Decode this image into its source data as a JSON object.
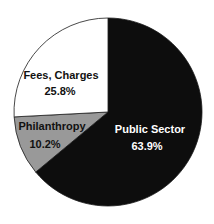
{
  "chart_data": {
    "type": "pie",
    "title": "",
    "start_angle_deg": 0,
    "direction": "clockwise",
    "center": [
      108,
      112
    ],
    "radius": 94,
    "stroke": "#1a1a1a",
    "slices": [
      {
        "label": "Public Sector",
        "value": 63.9,
        "value_label": "63.9%",
        "color": "#0d0d0d",
        "text_color": "#ffffff",
        "label_pos": [
          150,
          133
        ],
        "value_pos": [
          147,
          150
        ]
      },
      {
        "label": "Philanthropy",
        "value": 10.2,
        "value_label": "10.2%",
        "color": "#999999",
        "text_color": "#111111",
        "label_pos": [
          52,
          130
        ],
        "value_pos": [
          45,
          148
        ]
      },
      {
        "label": "Fees, Charges",
        "value": 25.8,
        "value_label": "25.8%",
        "color": "#ffffff",
        "text_color": "#111111",
        "label_pos": [
          61,
          79
        ],
        "value_pos": [
          60,
          95
        ]
      }
    ],
    "legend": "none",
    "units": "%"
  }
}
